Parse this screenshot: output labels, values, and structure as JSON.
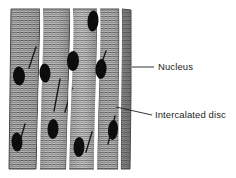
{
  "figure": {
    "type": "histology-diagram",
    "background_color": "#ffffff",
    "tissue": {
      "fill_light": "#d8d8d8",
      "fill_mid": "#9a9a9a",
      "fill_dark": "#6e6e6e",
      "striation_color": "#3a3a3a",
      "outline_color": "#4a4a4a",
      "gap_color": "#ffffff",
      "bounds": {
        "x": 9,
        "y": 8,
        "width": 122,
        "height": 162
      }
    },
    "fiber_columns": [
      {
        "id": "fiber-1",
        "top_left": 11,
        "top_right": 40,
        "bottom_left": 9,
        "bottom_right": 36
      },
      {
        "id": "fiber-2",
        "top_left": 43,
        "top_right": 70,
        "bottom_left": 39,
        "bottom_right": 66
      },
      {
        "id": "fiber-3",
        "top_left": 73,
        "top_right": 97,
        "bottom_left": 69,
        "bottom_right": 94
      },
      {
        "id": "fiber-4",
        "top_left": 100,
        "top_right": 119,
        "bottom_left": 97,
        "bottom_right": 118
      },
      {
        "id": "fiber-5",
        "top_left": 122,
        "top_right": 131,
        "bottom_left": 121,
        "bottom_right": 130
      }
    ],
    "nuclei": [
      {
        "id": "nucleus-1",
        "cx": 93,
        "cy": 21,
        "rx": 5.5,
        "ry": 10.5,
        "angle": 4
      },
      {
        "id": "nucleus-2",
        "cx": 73,
        "cy": 61,
        "rx": 6,
        "ry": 10,
        "angle": 2
      },
      {
        "id": "nucleus-3",
        "cx": 101,
        "cy": 69,
        "rx": 5.5,
        "ry": 10,
        "angle": 3
      },
      {
        "id": "nucleus-4",
        "cx": 45,
        "cy": 73,
        "rx": 5.5,
        "ry": 9.5,
        "angle": -3
      },
      {
        "id": "nucleus-5",
        "cx": 19,
        "cy": 76,
        "rx": 6,
        "ry": 9.5,
        "angle": -2
      },
      {
        "id": "nucleus-6",
        "cx": 53,
        "cy": 129,
        "rx": 5.5,
        "ry": 10,
        "angle": 2
      },
      {
        "id": "nucleus-7",
        "cx": 113,
        "cy": 130,
        "rx": 5,
        "ry": 10,
        "angle": 4
      },
      {
        "id": "nucleus-8",
        "cx": 17,
        "cy": 142,
        "rx": 5.5,
        "ry": 9.5,
        "angle": -3
      },
      {
        "id": "nucleus-9",
        "cx": 79,
        "cy": 147,
        "rx": 5.5,
        "ry": 10,
        "angle": 2
      }
    ],
    "intercalated_discs": [
      {
        "id": "disc-1",
        "x1": 36,
        "y1": 47,
        "x2": 29,
        "y2": 68
      },
      {
        "id": "disc-2",
        "x1": 60,
        "y1": 79,
        "x2": 54,
        "y2": 111
      },
      {
        "id": "disc-3",
        "x1": 106,
        "y1": 51,
        "x2": 100,
        "y2": 68
      },
      {
        "id": "disc-4",
        "x1": 72,
        "y1": 88,
        "x2": 65,
        "y2": 112
      },
      {
        "id": "disc-5",
        "x1": 25,
        "y1": 124,
        "x2": 20,
        "y2": 141
      },
      {
        "id": "disc-6",
        "x1": 115,
        "y1": 116,
        "x2": 108,
        "y2": 144
      },
      {
        "id": "disc-7",
        "x1": 92,
        "y1": 132,
        "x2": 86,
        "y2": 152
      }
    ]
  },
  "labels": [
    {
      "id": "nucleus",
      "text": "Nucleus",
      "text_x": 158,
      "text_y": 62,
      "leader": {
        "x1": 132,
        "y1": 67,
        "x2": 154,
        "y2": 67
      },
      "color": "#231f20"
    },
    {
      "id": "intercalated-disc",
      "text": "Intercalated disc",
      "text_x": 155,
      "text_y": 110,
      "leader": {
        "x1": 116,
        "y1": 107,
        "x2": 152,
        "y2": 115
      },
      "color": "#231f20"
    }
  ]
}
